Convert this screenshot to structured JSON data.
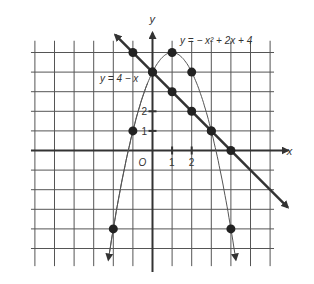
{
  "figure": {
    "axes": {
      "x_label": "x",
      "y_label": "y",
      "origin_label": "O"
    },
    "x_ticks": [
      {
        "value": 1,
        "label": "1"
      },
      {
        "value": 2,
        "label": "2"
      }
    ],
    "y_ticks": [
      {
        "value": 1,
        "label": "1"
      },
      {
        "value": 2,
        "label": "2"
      }
    ],
    "curves": [
      {
        "name": "line",
        "label": "y = 4 − x",
        "points": [
          [
            -1,
            5
          ],
          [
            0,
            4
          ],
          [
            1,
            3
          ],
          [
            2,
            2
          ],
          [
            3,
            1
          ],
          [
            4,
            0
          ]
        ]
      },
      {
        "name": "parabola",
        "label": "y = − x² + 2x + 4",
        "points": [
          [
            -2,
            -4
          ],
          [
            -1,
            1
          ],
          [
            0,
            4
          ],
          [
            1,
            5
          ],
          [
            2,
            4
          ],
          [
            3,
            1
          ],
          [
            4,
            -4
          ]
        ]
      }
    ],
    "grid": {
      "x_range": [
        -6,
        6
      ],
      "y_range": [
        -5,
        5
      ]
    }
  }
}
